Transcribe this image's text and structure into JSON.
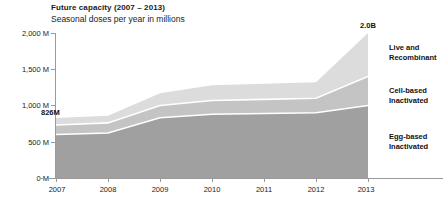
{
  "header": {
    "title": "Future capacity (2007 – 2013)",
    "subtitle": "Seasonal doses per year in millions"
  },
  "annotations": {
    "start_total": "826M",
    "end_total": "2.0B"
  },
  "axes": {
    "y_labels": [
      "2,000 M",
      "1,500 M",
      "1,000 M",
      "500 M",
      "0 M"
    ],
    "x_labels": [
      "2007",
      "2008",
      "2009",
      "2010",
      "2011",
      "2012",
      "2013"
    ]
  },
  "series_labels": [
    {
      "line1": "Live and",
      "line2": "Recombinant"
    },
    {
      "line1": "Cell-based",
      "line2": "Inactivated"
    },
    {
      "line1": "Egg-based",
      "line2": "Inactivated"
    }
  ],
  "colors": {
    "egg_based": "#a0a0a0",
    "cell_based": "#c4c4c4",
    "live_recombinant": "#dcdcdc",
    "separator": "#ffffff",
    "axis": "#9a9a9a",
    "text": "#1a1a1a"
  },
  "chart_data": {
    "type": "area",
    "title": "Future capacity (2007 – 2013)",
    "subtitle": "Seasonal doses per year in millions",
    "xlabel": "",
    "ylabel": "Seasonal doses per year in millions",
    "x": [
      2007,
      2008,
      2009,
      2010,
      2011,
      2012,
      2013
    ],
    "categories": [
      "2007",
      "2008",
      "2009",
      "2010",
      "2011",
      "2012",
      "2013"
    ],
    "stacked": true,
    "ylim": [
      0,
      2000
    ],
    "yticks": [
      0,
      500,
      1000,
      1500,
      2000
    ],
    "ytick_labels": [
      "0 M",
      "500 M",
      "1,000 M",
      "1,500 M",
      "2,000 M"
    ],
    "grid": false,
    "legend_position": "right",
    "units": "millions of doses",
    "series": [
      {
        "name": "Egg-based Inactivated",
        "values": [
          600,
          620,
          830,
          880,
          890,
          900,
          1000
        ]
      },
      {
        "name": "Cell-based Inactivated",
        "values": [
          130,
          140,
          170,
          190,
          195,
          200,
          400
        ]
      },
      {
        "name": "Live and Recombinant",
        "values": [
          96,
          100,
          170,
          210,
          215,
          220,
          600
        ]
      }
    ],
    "totals": [
      826,
      860,
      1170,
      1280,
      1300,
      1320,
      2000
    ],
    "annotations": [
      {
        "x": 2007,
        "y": 826,
        "text": "826M"
      },
      {
        "x": 2013,
        "y": 2000,
        "text": "2.0B"
      }
    ]
  },
  "geometry": {
    "y_positions": [
      33,
      69.25,
      105.5,
      141.75,
      178
    ],
    "x_positions": [
      56,
      108,
      160,
      212,
      264,
      316,
      368
    ]
  }
}
